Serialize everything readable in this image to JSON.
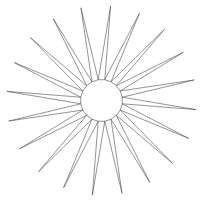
{
  "figure": {
    "kind": "vector-line-drawing",
    "background_color": "#ffffff",
    "stroke_color": "#3a3a3a",
    "fill_color": "none",
    "stroke_width": 0.55,
    "canvas": {
      "width": 203,
      "height": 201
    }
  },
  "chart_data": {
    "type": "scatter",
    "xlabel": "",
    "ylabel": "",
    "subtitle": "",
    "legend": [],
    "annotations": [],
    "grid": false,
    "xlim": [
      0,
      203
    ],
    "ylim": [
      0,
      201
    ],
    "geometry": {
      "shape": "starburst",
      "spike_count": 20,
      "center_x": 101.5,
      "center_y": 100.5,
      "inner_radius": 21,
      "outer_radius": 95,
      "base_half_angle_deg": 9.0,
      "skew_deg": 5.5,
      "angle_step_deg": 18,
      "start_angle_deg": -90
    },
    "categories": [
      "spike-01",
      "spike-02",
      "spike-03",
      "spike-04",
      "spike-05",
      "spike-06",
      "spike-07",
      "spike-08",
      "spike-09",
      "spike-10",
      "spike-11",
      "spike-12",
      "spike-13",
      "spike-14",
      "spike-15",
      "spike-16",
      "spike-17",
      "spike-18",
      "spike-19",
      "spike-20"
    ],
    "values": [
      95,
      95,
      95,
      95,
      95,
      95,
      95,
      95,
      95,
      95,
      95,
      95,
      95,
      95,
      95,
      95,
      95,
      95,
      95,
      95
    ],
    "tip_angles_deg": [
      -90,
      -72,
      -54,
      -36,
      -18,
      0,
      18,
      36,
      54,
      72,
      90,
      108,
      126,
      144,
      162,
      180,
      198,
      216,
      234,
      252
    ]
  }
}
